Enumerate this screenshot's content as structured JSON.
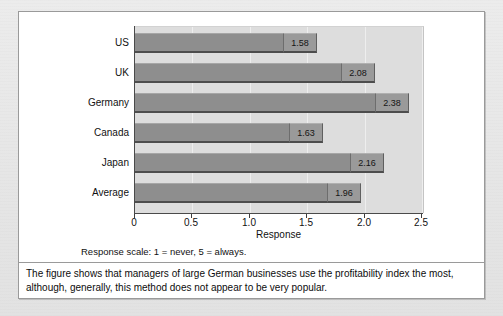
{
  "chart_data": {
    "type": "bar",
    "orientation": "horizontal",
    "title": "",
    "xlabel": "Response",
    "ylabel": "",
    "xlim": [
      0,
      2.5
    ],
    "grid": true,
    "legend": "none",
    "categories": [
      "US",
      "UK",
      "Germany",
      "Canada",
      "Japan",
      "Average"
    ],
    "values": [
      1.58,
      2.08,
      2.38,
      1.63,
      2.16,
      1.96
    ],
    "value_labels": [
      "1.58",
      "2.08",
      "2.38",
      "1.63",
      "2.16",
      "1.96"
    ],
    "x_ticks": [
      0,
      0.5,
      1.0,
      1.5,
      2.0,
      2.5
    ],
    "x_tick_labels": [
      "0",
      "0.5",
      "1.0",
      "1.5",
      "2.0",
      "2.5"
    ],
    "bar_color": "#8e8e8e",
    "plot_background": "#dddddd",
    "annotations": [
      "Response scale: 1 = never, 5 = always."
    ]
  },
  "axis": {
    "x_title": "Response"
  },
  "notes": {
    "scale_note": "Response scale: 1 = never, 5 = always.",
    "caption": "The figure shows that managers of large German businesses use the profitability index the most, although, generally, this method does not appear to be very popular."
  }
}
